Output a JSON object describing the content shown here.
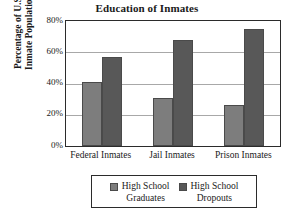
{
  "chart_data": {
    "type": "bar",
    "title": "Education of Inmates",
    "xlabel": "",
    "ylabel": "Percentage of U.S. Inmate Population",
    "ylabel_line1": "Percentage of U.S.",
    "ylabel_line2": "Inmate Population",
    "categories": [
      "Federal Inmates",
      "Jail Inmates",
      "Prison Inmates"
    ],
    "series": [
      {
        "name": "High School Graduates",
        "name_line1": "High School",
        "name_line2": "Graduates",
        "color": "#7d7d7d",
        "values": [
          41,
          30.5,
          26.5
        ]
      },
      {
        "name": "High School Dropouts",
        "name_line1": "High School",
        "name_line2": "Dropouts",
        "color": "#585858",
        "values": [
          57,
          68,
          75
        ]
      }
    ],
    "ylim": [
      0,
      80
    ],
    "yticks": [
      0,
      20,
      40,
      60,
      80
    ],
    "ytick_labels": [
      "0%",
      "20%",
      "40%",
      "60%",
      "80%"
    ],
    "grid": true,
    "legend_position": "bottom"
  }
}
